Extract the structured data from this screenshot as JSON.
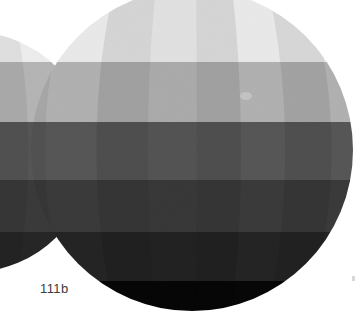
{
  "page": {
    "background_color": "#ffffff",
    "width": 363,
    "height": 322
  },
  "caption": {
    "label": "111b",
    "color": "#3b3b3b",
    "x": 40,
    "y": 281
  },
  "figure": {
    "type": "tonal-sphere-diagram",
    "speck": {
      "x": 246,
      "y": 96,
      "rx": 6,
      "ry": 4,
      "color": "#c9c9c9"
    },
    "edge_mark": {
      "x": 352,
      "y": 276,
      "color": "#d8d8d8"
    },
    "spheres": [
      {
        "name": "partial-sphere-left",
        "cx": -28,
        "cy": 152,
        "r": 120,
        "clipped": "left edge of frame",
        "bands": [
          {
            "from": -1000,
            "to": 62,
            "color": "#ececec"
          },
          {
            "from": 62,
            "to": 122,
            "color": "#b4b4b4"
          },
          {
            "from": 122,
            "to": 180,
            "color": "#555555"
          },
          {
            "from": 180,
            "to": 232,
            "color": "#3a3a3a"
          },
          {
            "from": 232,
            "to": 282,
            "color": "#262626"
          },
          {
            "from": 282,
            "to": 1000,
            "color": "#0a0a0a"
          }
        ],
        "gores": [
          {
            "x0": -148,
            "x1": -118,
            "shade": "rgba(0,0,0,0.05)"
          },
          {
            "x0": -118,
            "x1": -86,
            "shade": "rgba(0,0,0,0.00)"
          },
          {
            "x0": -86,
            "x1": -52,
            "shade": "rgba(0,0,0,0.07)"
          },
          {
            "x0": -52,
            "x1": -16,
            "shade": "rgba(0,0,0,0.00)"
          },
          {
            "x0": -16,
            "x1": 18,
            "shade": "rgba(0,0,0,0.06)"
          },
          {
            "x0": 18,
            "x1": 52,
            "shade": "rgba(0,0,0,0.00)"
          },
          {
            "x0": 52,
            "x1": 92,
            "shade": "rgba(0,0,0,0.08)"
          }
        ]
      },
      {
        "name": "main-sphere",
        "cx": 192,
        "cy": 150,
        "r": 161,
        "clipped": "top edge of frame",
        "bands": [
          {
            "from": -1000,
            "to": 62,
            "color": "#e8e8e8"
          },
          {
            "from": 62,
            "to": 122,
            "color": "#b0b0b0"
          },
          {
            "from": 122,
            "to": 180,
            "color": "#565656"
          },
          {
            "from": 180,
            "to": 232,
            "color": "#3a3a3a"
          },
          {
            "from": 232,
            "to": 281,
            "color": "#242424"
          },
          {
            "from": 281,
            "to": 1000,
            "color": "#070707"
          }
        ],
        "gores": [
          {
            "x0": 31,
            "x1": 72,
            "shade": "rgba(0,0,0,0.055)"
          },
          {
            "x0": 72,
            "x1": 114,
            "shade": "rgba(0,0,0,0.000)"
          },
          {
            "x0": 114,
            "x1": 156,
            "shade": "rgba(0,0,0,0.085)"
          },
          {
            "x0": 156,
            "x1": 196,
            "shade": "rgba(0,0,0,0.030)"
          },
          {
            "x0": 196,
            "x1": 232,
            "shade": "rgba(0,0,0,0.085)"
          },
          {
            "x0": 232,
            "x1": 268,
            "shade": "rgba(0,0,0,0.000)"
          },
          {
            "x0": 268,
            "x1": 306,
            "shade": "rgba(0,0,0,0.075)"
          },
          {
            "x0": 306,
            "x1": 355,
            "shade": "rgba(0,0,0,0.000)"
          }
        ]
      }
    ],
    "palette": {
      "band_1": "#e8e8e8",
      "band_2": "#b0b0b0",
      "band_3": "#565656",
      "band_4": "#3a3a3a",
      "band_5": "#242424",
      "band_6": "#070707",
      "paper": "#ffffff",
      "caption": "#3b3b3b"
    }
  }
}
